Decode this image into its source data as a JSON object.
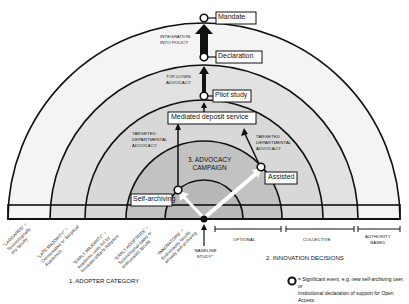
{
  "diagram": {
    "nodes": [
      {
        "id": "mandate",
        "label": "Mandate"
      },
      {
        "id": "declaration",
        "label": "Declaration"
      },
      {
        "id": "pilot",
        "label": "Pilot study"
      },
      {
        "id": "mediated",
        "label": "Mediated deposit service"
      },
      {
        "id": "assisted",
        "label": "Assisted"
      },
      {
        "id": "selfarch",
        "label": "Self-archiving"
      }
    ],
    "arrow_labels": {
      "integration": [
        "INTEGRATION",
        "INTO POLICY"
      ],
      "topdown": [
        "TOP-DOWN",
        "ADVOCACY"
      ],
      "targeted_left": [
        "TARGETED",
        "DEPARTMENTAL",
        "ADVOCACY"
      ],
      "targeted_right": [
        "TARGETED",
        "DEPARTMENTAL",
        "ADVOCACY"
      ],
      "inner_left": "ADVOCACY",
      "inner_right": "ADVOCACY"
    },
    "campaign_label": [
      "3. ADVOCACY",
      "CAMPAIGN"
    ],
    "adopter_categories": [
      {
        "name": "\"LAGGARDS\" =",
        "desc": [
          "Technologically",
          "shy faculty"
        ]
      },
      {
        "name": "\"LATE MAJORITY\" =",
        "desc": [
          "Conservative or Skeptical",
          "Academics"
        ]
      },
      {
        "name": "\"EARLY MAJORITY\" =",
        "desc": [
          "Academic units led by",
          "Innovators/Early Adopters"
        ]
      },
      {
        "name": "\"EARLY ADOPTERS\" =",
        "desc": [
          "Technological savvy or",
          "enthusiastic faculty"
        ]
      },
      {
        "name": "\"INNOVATORS\" =",
        "desc": [
          "Enthusiastic faculty",
          "already self-archiving"
        ]
      }
    ],
    "baseline": [
      "\"BASELINE",
      "STUDY\""
    ],
    "decision_types": [
      "OPTIONAL",
      "COLLECTIVE",
      [
        "AUTHORITY",
        "BASED"
      ]
    ],
    "axis_titles": {
      "adopter": "1. ADOPTER CATEGORY",
      "innovation": "2. INNOVATION DECISIONS"
    },
    "legend": {
      "symbol": "circle-marker",
      "text_line1": "= Significant event, e.g. new self-archiving user, or",
      "text_line2": "Institutional declaration of support for Open Access."
    },
    "colors": {
      "outer_band": "#f2f2f2",
      "mid_band": "#dcdcdc",
      "campaign_band": "#c4c4c4",
      "inner_band": "#b3b3b3",
      "stroke": "#111111"
    }
  }
}
